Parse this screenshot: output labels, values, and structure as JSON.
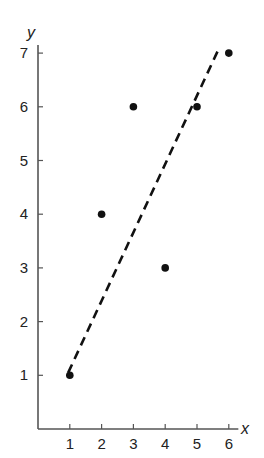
{
  "chart_data": {
    "type": "scatter",
    "title": "",
    "xlabel": "x",
    "ylabel": "y",
    "xlim": [
      0,
      6.3
    ],
    "ylim": [
      0,
      7.2
    ],
    "x_ticks": [
      1,
      2,
      3,
      4,
      5,
      6
    ],
    "y_ticks": [
      1,
      2,
      3,
      4,
      5,
      6,
      7
    ],
    "grid": false,
    "legend": null,
    "series": [
      {
        "name": "data points",
        "type": "scatter",
        "marker": "filled-circle",
        "x": [
          1,
          2,
          3,
          4,
          5,
          6
        ],
        "y": [
          1,
          4,
          6,
          3,
          6,
          7
        ]
      },
      {
        "name": "trend line",
        "type": "line",
        "style": "dashed",
        "x": [
          0.95,
          5.7
        ],
        "y": [
          1.05,
          7.1
        ]
      }
    ]
  },
  "colors": {
    "axis": "#555555",
    "points": "#111111",
    "trend_line": "#111111",
    "background": "#ffffff"
  }
}
